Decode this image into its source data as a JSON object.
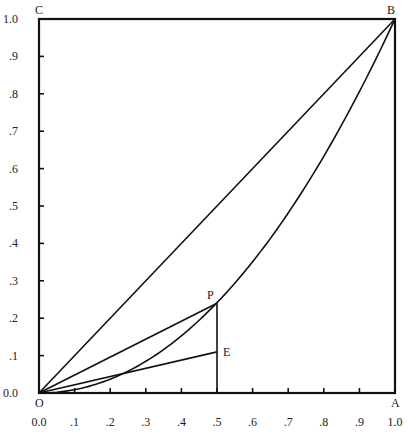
{
  "diagram": {
    "plot_area": {
      "left": 39,
      "top": 19,
      "right": 395,
      "bottom": 393
    },
    "x_ticks": [
      {
        "v": 0.0,
        "label": "0.0"
      },
      {
        "v": 0.1,
        "label": ".1"
      },
      {
        "v": 0.2,
        "label": ".2"
      },
      {
        "v": 0.3,
        "label": ".3"
      },
      {
        "v": 0.4,
        "label": ".4"
      },
      {
        "v": 0.5,
        "label": ".5"
      },
      {
        "v": 0.6,
        "label": ".6"
      },
      {
        "v": 0.7,
        "label": ".7"
      },
      {
        "v": 0.8,
        "label": ".8"
      },
      {
        "v": 0.9,
        "label": ".9"
      },
      {
        "v": 1.0,
        "label": "1.0"
      }
    ],
    "y_ticks": [
      {
        "v": 0.0,
        "label": "0.0"
      },
      {
        "v": 0.1,
        "label": ".1"
      },
      {
        "v": 0.2,
        "label": ".2"
      },
      {
        "v": 0.3,
        "label": ".3"
      },
      {
        "v": 0.4,
        "label": ".4"
      },
      {
        "v": 0.5,
        "label": ".5"
      },
      {
        "v": 0.6,
        "label": ".6"
      },
      {
        "v": 0.7,
        "label": ".7"
      },
      {
        "v": 0.8,
        "label": ".8"
      },
      {
        "v": 0.9,
        "label": ".9"
      },
      {
        "v": 1.0,
        "label": "1.0"
      }
    ],
    "points": {
      "O": {
        "label": "O",
        "x": 0.0,
        "y": 0.0
      },
      "A": {
        "label": "A",
        "x": 1.0,
        "y": 0.0
      },
      "B": {
        "label": "B",
        "x": 1.0,
        "y": 1.0
      },
      "C": {
        "label": "C",
        "x": 0.0,
        "y": 1.0
      },
      "P": {
        "label": "P",
        "x": 0.5,
        "y": 0.24
      },
      "E": {
        "label": "E",
        "x": 0.5,
        "y": 0.11
      }
    },
    "curve": {
      "name": "lorenz-curve",
      "exponent": 2.05
    },
    "segments": [
      {
        "name": "diagonal-OB",
        "from": "O",
        "to": "B"
      },
      {
        "name": "chord-OP",
        "from": "O",
        "to": "P"
      },
      {
        "name": "line-OE",
        "from": "O",
        "to": "E"
      },
      {
        "name": "vertical-PE-to-axis",
        "from": "P",
        "to_x": 0.5,
        "to_y": 0.0
      }
    ]
  }
}
